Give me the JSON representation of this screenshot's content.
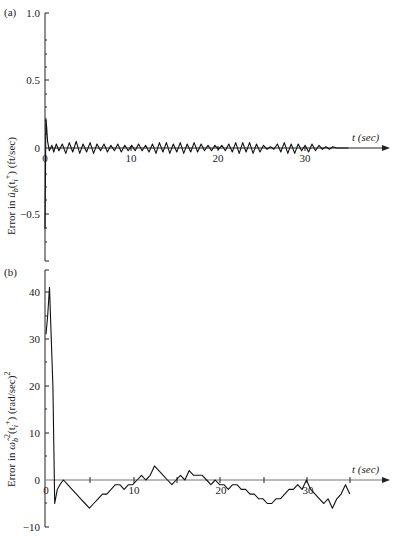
{
  "chart_data": [
    {
      "panel": "(a)",
      "type": "line",
      "title": "",
      "xlabel": "t (sec)",
      "ylabel": "Error in û_b(t_i⁺) (ft/sec)",
      "xlim": [
        0,
        39
      ],
      "ylim": [
        -0.85,
        1.0
      ],
      "xticks": [
        0,
        10,
        20,
        30
      ],
      "xtick_labels": [
        "0",
        "10",
        "20",
        "30"
      ],
      "yticks": [
        1.0,
        0.5,
        0,
        -0.5
      ],
      "ytick_labels": [
        "1.0",
        "0.5",
        "0",
        "−0.5"
      ],
      "grid": false,
      "description": "Initial spike to about 0.22 and dip to about -0.6 near t=0, followed by small oscillations (about ±0.04) around zero until t≈35 sec",
      "x": [
        0,
        0.1,
        0.2,
        0.3,
        0.5,
        0.8,
        1.0,
        1.3,
        1.6,
        2.0,
        2.4,
        2.8,
        3.2,
        3.6,
        4.0,
        4.4,
        4.8,
        5.2,
        5.6,
        6.0,
        6.4,
        6.8,
        7.2,
        7.6,
        8.0,
        8.4,
        8.8,
        9.2,
        9.6,
        10.0,
        10.4,
        10.8,
        11.2,
        11.6,
        12.0,
        12.4,
        12.8,
        13.2,
        13.6,
        14.0,
        14.4,
        14.8,
        15.2,
        15.6,
        16.0,
        16.4,
        16.8,
        17.2,
        17.6,
        18.0,
        18.4,
        18.8,
        19.2,
        19.6,
        20.0,
        20.4,
        20.8,
        21.2,
        21.6,
        22.0,
        22.4,
        22.8,
        23.2,
        23.6,
        24.0,
        24.4,
        24.8,
        25.2,
        25.6,
        26.0,
        26.4,
        26.8,
        27.2,
        27.6,
        28.0,
        28.4,
        28.8,
        29.2,
        29.6,
        30.0,
        30.4,
        30.8,
        31.2,
        31.6,
        32.0,
        32.4,
        32.8,
        33.2,
        33.6,
        34.0,
        34.4,
        34.8,
        35.0
      ],
      "y": [
        -0.6,
        0.22,
        0.15,
        0.05,
        -0.02,
        0.02,
        -0.03,
        0.03,
        -0.02,
        0.03,
        -0.04,
        0.04,
        -0.03,
        0.05,
        -0.04,
        0.03,
        -0.03,
        0.04,
        -0.04,
        0.03,
        -0.02,
        0.03,
        -0.03,
        0.02,
        -0.02,
        0.03,
        -0.03,
        0.02,
        -0.02,
        0.02,
        -0.02,
        0.03,
        -0.02,
        0.02,
        -0.03,
        0.03,
        -0.04,
        0.04,
        -0.03,
        0.04,
        -0.04,
        0.03,
        -0.03,
        0.04,
        -0.04,
        0.03,
        -0.03,
        0.04,
        -0.03,
        0.03,
        -0.02,
        0.02,
        -0.02,
        0.02,
        -0.01,
        0.02,
        -0.02,
        0.03,
        -0.03,
        0.04,
        -0.04,
        0.04,
        -0.03,
        0.04,
        -0.04,
        0.03,
        -0.03,
        0.02,
        -0.01,
        0.01,
        -0.01,
        0.03,
        -0.03,
        0.04,
        -0.04,
        0.03,
        -0.04,
        0.03,
        -0.02,
        0.02,
        -0.03,
        0.03,
        -0.02,
        0.02,
        -0.01,
        0.01,
        -0.01,
        0.01,
        0.0,
        0.0,
        0.0,
        0.0,
        0.0
      ]
    },
    {
      "panel": "(b)",
      "type": "line",
      "title": "",
      "xlabel": "t (sec)",
      "ylabel": "Error in ω̂²_b(t_i⁺) (rad/sec)²",
      "xlim": [
        0,
        39
      ],
      "ylim": [
        -10,
        44
      ],
      "xticks": [
        0,
        5,
        10,
        15,
        20,
        25,
        30,
        35
      ],
      "xtick_labels": [
        "0",
        "",
        "10",
        "",
        "20",
        "",
        "30",
        ""
      ],
      "yticks": [
        40,
        30,
        20,
        10,
        0,
        -10
      ],
      "ytick_labels": [
        "40",
        "30",
        "20",
        "10",
        "0",
        "−10"
      ],
      "grid": false,
      "description": "Initial value ~31 rising to ~41 then dropping to ~-5 by t≈1; wanders between about -6 and +3 for remainder, ending near t≈35",
      "x": [
        0,
        0.2,
        0.4,
        0.8,
        1.0,
        1.3,
        1.6,
        2.0,
        2.5,
        3.0,
        3.5,
        4.0,
        4.5,
        5.0,
        5.5,
        6.0,
        6.5,
        7.0,
        7.5,
        8.0,
        8.5,
        9.0,
        9.5,
        10.0,
        10.5,
        11.0,
        11.5,
        12.0,
        12.5,
        13.0,
        13.5,
        14.0,
        14.5,
        15.0,
        15.5,
        16.0,
        16.5,
        17.0,
        17.5,
        18.0,
        18.5,
        19.0,
        19.5,
        20.0,
        20.5,
        21.0,
        21.5,
        22.0,
        22.5,
        23.0,
        23.5,
        24.0,
        24.5,
        25.0,
        25.5,
        26.0,
        26.5,
        27.0,
        27.5,
        28.0,
        28.5,
        29.0,
        29.5,
        30.0,
        30.5,
        31.0,
        31.5,
        32.0,
        32.5,
        33.0,
        33.5,
        34.0,
        34.5,
        35.0
      ],
      "y": [
        31,
        35,
        41,
        20,
        -5,
        -2,
        -1,
        0,
        -1,
        -2,
        -3,
        -4,
        -5,
        -6,
        -5,
        -4,
        -3,
        -3,
        -2,
        -1,
        -1,
        -2,
        -1,
        -1,
        0,
        1,
        0,
        1,
        3,
        2,
        1,
        0,
        -1,
        0,
        1,
        0,
        2,
        1,
        1,
        1,
        0,
        -1,
        0,
        -1,
        -1,
        -2,
        -1,
        -1,
        -2,
        -2,
        -3,
        -3,
        -4,
        -4,
        -5,
        -5,
        -4,
        -4,
        -3,
        -2,
        -2,
        -1,
        -2,
        0,
        -2,
        -3,
        -4,
        -5,
        -4,
        -6,
        -4,
        -3,
        -1,
        -3
      ]
    }
  ],
  "panels": {
    "a": {
      "tag": "(a)",
      "ylabel_prefix": "Error in ",
      "ylabel_var": "û",
      "ylabel_sub": "b",
      "ylabel_arg": "(t",
      "ylabel_argsub": "i",
      "ylabel_argsup": "+",
      "ylabel_suffix": ") (ft/sec)",
      "xlabel": "t (sec)",
      "ytick_labels": [
        "1.0",
        "0.5",
        "0",
        "−0.5"
      ],
      "xtick_labels": [
        "0",
        "10",
        "20",
        "30"
      ]
    },
    "b": {
      "tag": "(b)",
      "ylabel_prefix": "Error in ",
      "ylabel_var": "ω̂",
      "ylabel_sub": "b",
      "ylabel_sup": "2",
      "ylabel_arg": "(t",
      "ylabel_argsub": "i",
      "ylabel_argsup": "+",
      "ylabel_suffix": ") (rad/sec)",
      "ylabel_unitsup": "2",
      "xlabel": "t (sec)",
      "ytick_labels": [
        "40",
        "30",
        "20",
        "10",
        "0",
        "−10"
      ],
      "xtick_labels": [
        "0",
        "10",
        "20",
        "30"
      ]
    }
  }
}
